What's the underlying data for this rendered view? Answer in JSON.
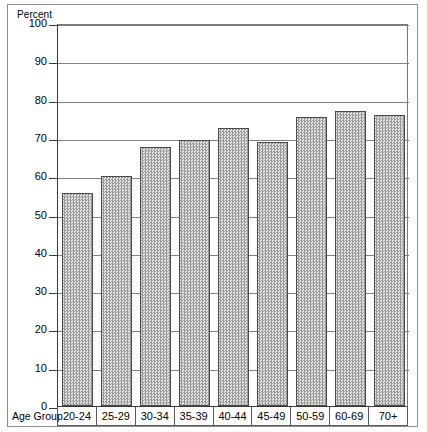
{
  "chart_data": {
    "type": "bar",
    "title": "",
    "xlabel": "Age Group",
    "ylabel": "Percent",
    "categories": [
      "20-24",
      "25-29",
      "30-34",
      "35-39",
      "40-44",
      "45-49",
      "50-59",
      "60-69",
      "70+"
    ],
    "values": [
      55.5,
      60,
      67.5,
      69.5,
      72.5,
      69,
      75.5,
      77,
      76
    ],
    "ylim": [
      0,
      100
    ],
    "ytick_labels": [
      "100",
      "90",
      "80",
      "70",
      "60",
      "50",
      "40",
      "30",
      "20",
      "10",
      "0"
    ],
    "ytick_values": [
      100,
      90,
      80,
      70,
      60,
      50,
      40,
      30,
      20,
      10,
      0
    ],
    "ytick_step": 10,
    "grid": true,
    "legend": "none",
    "bar_fill": "#b3b3b3",
    "bar_edge": "#4a4a4a",
    "axis_color": "#3a3a3a"
  }
}
